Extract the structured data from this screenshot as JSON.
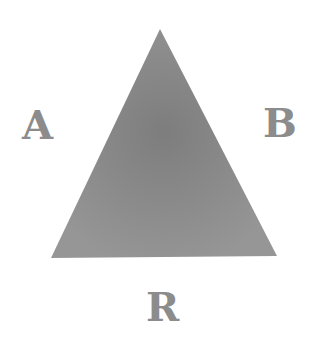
{
  "diagram": {
    "shape": "triangle",
    "fill_color": "#8f8f8f",
    "center_color": "#7a7a7a",
    "label_color": "#8c8c8c",
    "vertices": {
      "top": [
        160,
        29
      ],
      "bottom_left": [
        51,
        258
      ],
      "bottom_right": [
        277,
        256
      ]
    },
    "labels": {
      "left": "A",
      "right": "B",
      "bottom": "R"
    }
  }
}
